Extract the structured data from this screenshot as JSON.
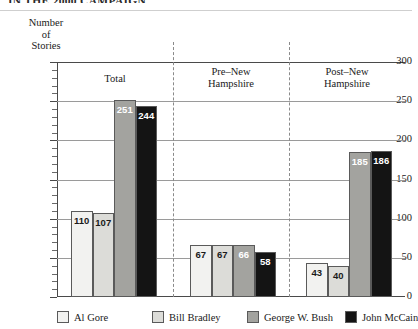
{
  "title": "IN THE 2000 CAMPAIGN",
  "axis_title_lines": [
    "Number",
    "of",
    "Stories"
  ],
  "chart_data": {
    "type": "bar",
    "title": "IN THE 2000 CAMPAIGN",
    "xlabel": "",
    "ylabel": "Number of Stories",
    "ylim": [
      0,
      300
    ],
    "yticks": [
      0,
      50,
      100,
      150,
      200,
      250,
      300
    ],
    "ytick_labels": [
      "0",
      "50",
      "100",
      "150",
      "200",
      "250",
      "300"
    ],
    "minor_tick_interval": 10,
    "grid": true,
    "legend_position": "bottom",
    "categories": [
      "Total",
      "Pre–New Hampshire",
      "Post–New Hampshire"
    ],
    "category_label_lines": [
      [
        "Total"
      ],
      [
        "Pre–New",
        "Hampshire"
      ],
      [
        "Post–New",
        "Hampshire"
      ]
    ],
    "series": [
      {
        "name": "Al Gore",
        "color": "#f2f2f0",
        "label_color": "dark",
        "values": [
          110,
          67,
          43
        ]
      },
      {
        "name": "Bill Bradley",
        "color": "#dcdcd8",
        "label_color": "dark",
        "values": [
          107,
          67,
          40
        ]
      },
      {
        "name": "George W. Bush",
        "color": "#a3a39f",
        "label_color": "light",
        "values": [
          251,
          66,
          185
        ]
      },
      {
        "name": "John McCain",
        "color": "#141414",
        "label_color": "light",
        "values": [
          244,
          58,
          186
        ]
      }
    ]
  },
  "legend": {
    "items": [
      {
        "label": "Al Gore",
        "color": "#f2f2f0"
      },
      {
        "label": "Bill Bradley",
        "color": "#dcdcd8"
      },
      {
        "label": "George W. Bush",
        "color": "#a3a39f"
      },
      {
        "label": "John McCain",
        "color": "#141414"
      }
    ]
  }
}
